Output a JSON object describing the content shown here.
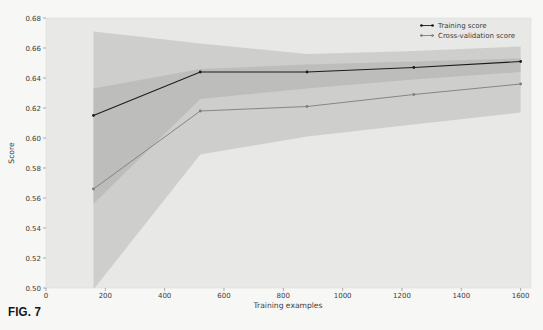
{
  "page": {
    "caption": "FIG. 7"
  },
  "chart_data": {
    "type": "line",
    "title": "",
    "xlabel": "Training examples",
    "ylabel": "Score",
    "xlim": [
      0,
      1635
    ],
    "ylim": [
      0.5,
      0.68
    ],
    "grid": false,
    "plot_bg": "#e8e8e6",
    "band_color": "#9a9a9a",
    "band_opacity": 0.33,
    "x_ticks": {
      "values": [
        0,
        200,
        400,
        600,
        800,
        1000,
        1200,
        1400,
        1600
      ],
      "labels": [
        "0",
        "200",
        "400",
        "600",
        "800",
        "1000",
        "1200",
        "1400",
        "1600"
      ]
    },
    "y_ticks": {
      "values": [
        0.5,
        0.52,
        0.54,
        0.56,
        0.58,
        0.6,
        0.62,
        0.64,
        0.66,
        0.68
      ],
      "labels": [
        "0.50",
        "0.52",
        "0.54",
        "0.56",
        "0.58",
        "0.60",
        "0.62",
        "0.64",
        "0.66",
        "0.68"
      ]
    },
    "x": [
      160,
      520,
      880,
      1240,
      1600
    ],
    "series": [
      {
        "name": "Training score",
        "values": [
          0.615,
          0.644,
          0.644,
          0.647,
          0.651
        ],
        "band_upper": [
          0.671,
          0.663,
          0.656,
          0.658,
          0.661
        ],
        "band_lower": [
          0.556,
          0.626,
          0.633,
          0.639,
          0.644
        ],
        "line_color": "#1c1c1c"
      },
      {
        "name": "Cross-validation score",
        "values": [
          0.566,
          0.618,
          0.621,
          0.629,
          0.636
        ],
        "band_upper": [
          0.633,
          0.646,
          0.649,
          0.651,
          0.653
        ],
        "band_lower": [
          0.499,
          0.589,
          0.601,
          0.609,
          0.617
        ],
        "line_color": "#7d7d7d"
      }
    ],
    "legend": {
      "position": "upper right",
      "entries": [
        "Training score",
        "Cross-validation score"
      ]
    }
  }
}
